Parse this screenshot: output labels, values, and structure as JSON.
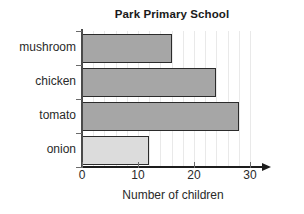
{
  "chart_data": {
    "type": "bar",
    "orientation": "horizontal",
    "title": "Park Primary School",
    "xlabel": "Number of children",
    "ylabel": "",
    "categories": [
      "mushroom",
      "chicken",
      "tomato",
      "onion"
    ],
    "values": [
      16,
      24,
      28,
      12
    ],
    "xlim": [
      0,
      30
    ],
    "xticks": [
      0,
      10,
      20,
      30
    ],
    "xtick_labels": [
      "0",
      "10",
      "20",
      "30"
    ],
    "grid": true,
    "grid_axis": "x",
    "grid_interval": 2,
    "legend": null,
    "bar_colors": [
      "#a6a6a6",
      "#a6a6a6",
      "#a6a6a6",
      "#dcdcdc"
    ],
    "bar_edge_color": "#2b2b2b",
    "grid_color": "#e9e9e9",
    "axis_color": "#1d1d1d",
    "background": "#ffffff"
  }
}
